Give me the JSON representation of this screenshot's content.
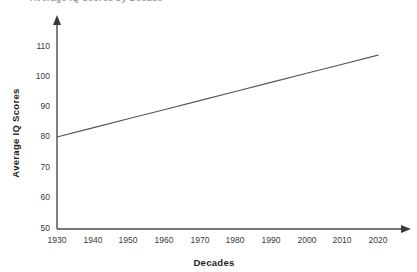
{
  "figure": {
    "background_color": "#ffffff",
    "clipped_heading": "Average IQ Scores by Decade",
    "axis_color": "#4a4a4a",
    "text_color": "#3a3a3a"
  },
  "chart_data": {
    "type": "line",
    "title": "",
    "xlabel": "Decades",
    "ylabel": "Average IQ Scores",
    "x": [
      1930,
      1940,
      1950,
      1960,
      1970,
      1980,
      1990,
      2000,
      2010,
      2020
    ],
    "xticklabels": [
      "1930",
      "1940",
      "1950",
      "1960",
      "1970",
      "1980",
      "1990",
      "2000",
      "2010",
      "2020"
    ],
    "yticks": [
      50,
      60,
      70,
      80,
      90,
      100,
      110
    ],
    "yticklabels": [
      "50",
      "60",
      "70",
      "80",
      "90",
      "100",
      "110"
    ],
    "xlim": [
      1930,
      2020
    ],
    "ylim": [
      50,
      112
    ],
    "grid": false,
    "legend": null,
    "series": [
      {
        "name": "Average IQ Score",
        "color": "#555555",
        "line_width": 1,
        "values": [
          80,
          83,
          86,
          89,
          92,
          95,
          98,
          101,
          104,
          107
        ]
      }
    ],
    "annotations": [],
    "axis_style": {
      "arrow_heads": true,
      "top_spine": false,
      "right_spine": false
    }
  },
  "labels": {
    "y_110": "110",
    "y_100": "100",
    "y_90": "90",
    "y_80": "80",
    "y_70": "70",
    "y_60": "60",
    "y_50": "50",
    "x_1930": "1930",
    "x_1940": "1940",
    "x_1950": "1950",
    "x_1960": "1960",
    "x_1970": "1970",
    "x_1980": "1980",
    "x_1990": "1990",
    "x_2000": "2000",
    "x_2010": "2010",
    "x_2020": "2020",
    "y_axis_title": "Average IQ Scores",
    "x_axis_title": "Decades"
  }
}
